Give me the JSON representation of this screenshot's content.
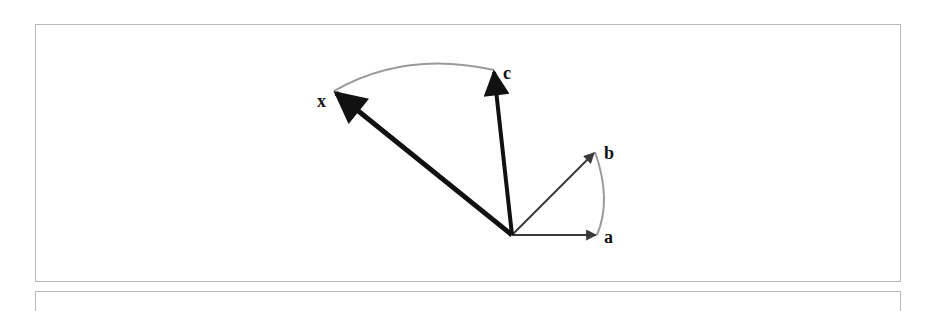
{
  "diagram": {
    "type": "vector-rotation",
    "origin": [
      512,
      235
    ],
    "vectors": [
      {
        "name": "a",
        "label": "a",
        "tip": [
          597,
          235
        ],
        "color": "#3a3a3a",
        "width": 2,
        "label_pos": [
          604,
          243
        ]
      },
      {
        "name": "b",
        "label": "b",
        "tip": [
          595,
          152
        ],
        "color": "#3a3a3a",
        "width": 2,
        "label_pos": [
          604,
          159
        ]
      },
      {
        "name": "c",
        "label": "c",
        "tip": [
          494,
          70
        ],
        "color": "#111111",
        "width": 4,
        "label_pos": [
          503,
          79
        ]
      },
      {
        "name": "x",
        "label": "x",
        "tip": [
          334,
          91
        ],
        "color": "#111111",
        "width": 5,
        "label_pos": [
          318,
          107
        ]
      }
    ],
    "arcs": [
      {
        "name": "arc-a-b",
        "from": "a",
        "to": "b",
        "color": "#9a9a9a"
      },
      {
        "name": "arc-x-c",
        "from": "x",
        "to": "c",
        "color": "#9a9a9a"
      }
    ]
  }
}
